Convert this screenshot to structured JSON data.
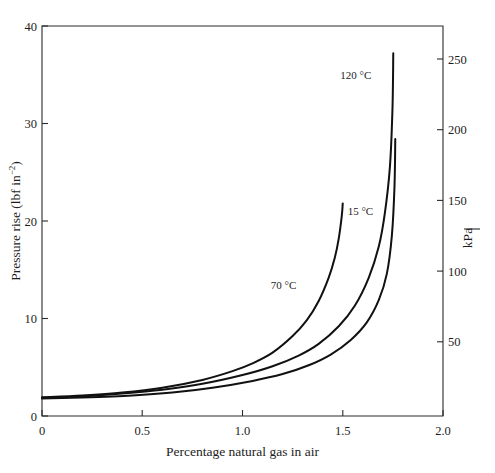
{
  "chart_data": {
    "type": "line",
    "title": "",
    "xlabel": "Percentage natural gas in air",
    "ylabel": "Pressure rise (lbf in−2)",
    "ylabel_main": "Pressure rise (lbf in",
    "ylabel_exp": "−2",
    "ylabel_tail": ")",
    "y2label": "kPa",
    "xlim": [
      0,
      2.0
    ],
    "ylim": [
      0,
      40
    ],
    "y2lim": [
      0,
      276
    ],
    "grid": false,
    "legend": "inline-curve-labels",
    "xticks": [
      0,
      0.5,
      1.0,
      1.5,
      2.0
    ],
    "xticklabels": [
      "0",
      "0.5",
      "1.0",
      "1.5",
      "2.0"
    ],
    "yticks": [
      0,
      10,
      20,
      30,
      40
    ],
    "yticklabels": [
      "0",
      "10",
      "20",
      "30",
      "40"
    ],
    "y2ticks": [
      50,
      100,
      150,
      200,
      250
    ],
    "y2ticklabels": [
      "50",
      "100",
      "150",
      "200",
      "250"
    ],
    "series": [
      {
        "name": "70 °C",
        "label": "70 °C",
        "label_x": 1.205,
        "label_y": 13.0,
        "x": [
          0.0,
          0.2,
          0.4,
          0.6,
          0.8,
          0.95,
          1.05,
          1.15,
          1.25,
          1.32,
          1.38,
          1.43,
          1.46,
          1.48,
          1.495,
          1.5
        ],
        "y": [
          1.9,
          2.1,
          2.4,
          2.9,
          3.7,
          4.6,
          5.4,
          6.5,
          8.2,
          9.8,
          11.8,
          14.2,
          16.2,
          18.2,
          20.5,
          21.8
        ]
      },
      {
        "name": "120 °C",
        "label": "120 °C",
        "label_x": 1.565,
        "label_y": 34.6,
        "x": [
          0.0,
          0.2,
          0.4,
          0.6,
          0.8,
          1.0,
          1.15,
          1.28,
          1.38,
          1.48,
          1.56,
          1.63,
          1.68,
          1.71,
          1.735,
          1.748,
          1.752
        ],
        "y": [
          1.9,
          2.0,
          2.3,
          2.7,
          3.3,
          4.2,
          5.1,
          6.2,
          7.4,
          9.2,
          11.3,
          14.2,
          17.4,
          20.8,
          25.5,
          31.5,
          37.2
        ]
      },
      {
        "name": "15 °C",
        "label": "15 °C",
        "label_x": 1.588,
        "label_y": 20.6,
        "x": [
          0.0,
          0.2,
          0.45,
          0.65,
          0.85,
          1.05,
          1.2,
          1.33,
          1.44,
          1.54,
          1.62,
          1.68,
          1.72,
          1.745,
          1.758,
          1.762
        ],
        "y": [
          1.8,
          1.9,
          2.1,
          2.4,
          2.9,
          3.6,
          4.3,
          5.2,
          6.3,
          7.8,
          9.6,
          11.9,
          14.6,
          18.5,
          23.5,
          28.4
        ]
      }
    ]
  },
  "axes": {
    "left_title": "Pressure rise (lbf in",
    "bottom_title": "Percentage natural gas in air",
    "right_title": "kPa"
  }
}
